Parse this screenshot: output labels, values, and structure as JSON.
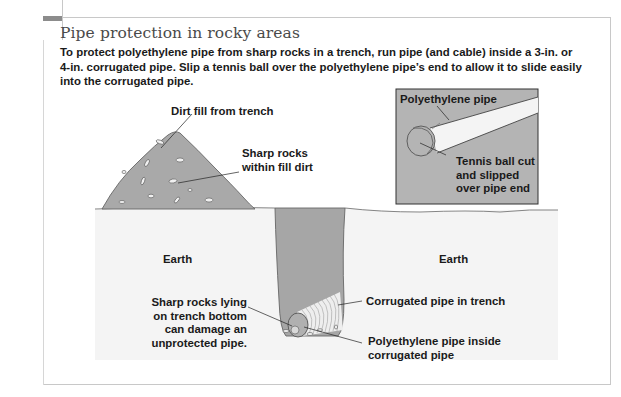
{
  "figure": {
    "title": "Pipe protection in rocky areas",
    "description_lines": [
      "To protect polyethylene pipe from sharp rocks in a trench, run pipe (and cable) inside a 3-in. or",
      "4-in. corrugated pipe. Slip a tennis ball over the polyethylene pipe’s end to allow it to slide easily",
      "into the corrugated pipe."
    ]
  },
  "labels": {
    "dirt_fill": "Dirt fill from trench",
    "sharp_rocks_fill": [
      "Sharp rocks",
      "within fill dirt"
    ],
    "earth_left": "Earth",
    "earth_right": "Earth",
    "sharp_rocks_bottom": [
      "Sharp rocks lying",
      "on trench bottom",
      "can damage an",
      "unprotected pipe."
    ],
    "corrugated_pipe": "Corrugated pipe in trench",
    "poly_inside": [
      "Polyethylene pipe inside",
      "corrugated pipe"
    ]
  },
  "inset": {
    "poly_pipe": "Polyethylene pipe",
    "tennis_ball": [
      "Tennis ball cut",
      "and slipped",
      "over pipe end"
    ]
  },
  "colors": {
    "dirt": "#a9a9a9",
    "trench": "#a6a6a6",
    "earth": "#f4f4f4",
    "inset_bg": "#b4b4b4",
    "outline": "#555555",
    "title": "#4a4a4a",
    "tab": "#8c8c8c"
  }
}
